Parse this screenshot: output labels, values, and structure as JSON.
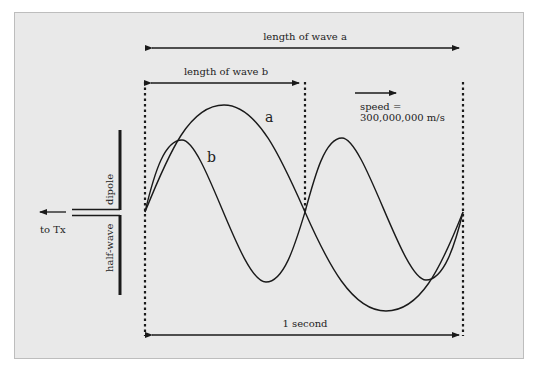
{
  "diagram": {
    "labels": {
      "wave_a_length": "length of wave a",
      "wave_b_length": "length of wave b",
      "speed_line1": "speed =",
      "speed_line2": "300,000,000 m/s",
      "one_second": "1 second",
      "wave_a": "a",
      "wave_b": "b",
      "dipole_top": "dipole",
      "dipole_bottom": "half-wave",
      "to_tx": "to Tx"
    },
    "colors": {
      "background": "#e9e9e9",
      "ink": "#1a1a1a",
      "border": "#bdbdbd"
    }
  }
}
